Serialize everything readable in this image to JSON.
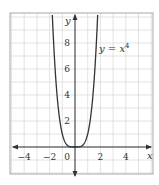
{
  "chart_data": {
    "type": "line",
    "title": "",
    "xlabel": "x",
    "ylabel": "y",
    "function": "y = x^4",
    "series": [
      {
        "name": "y = x⁴",
        "x": [
          -1.8,
          -1.6,
          -1.4,
          -1.2,
          -1.0,
          -0.8,
          -0.6,
          -0.4,
          -0.2,
          0,
          0.2,
          0.4,
          0.6,
          0.8,
          1.0,
          1.2,
          1.4,
          1.6,
          1.8
        ],
        "y": [
          10.5,
          6.55,
          3.84,
          2.07,
          1.0,
          0.41,
          0.13,
          0.026,
          0.0016,
          0,
          0.0016,
          0.026,
          0.13,
          0.41,
          1.0,
          2.07,
          3.84,
          6.55,
          10.5
        ]
      }
    ],
    "x_ticks": [
      -4,
      -2,
      0,
      2,
      4
    ],
    "x_tick_labels": [
      "−4",
      "−2",
      "0",
      "2",
      "4"
    ],
    "y_ticks": [
      2,
      4,
      6,
      8
    ],
    "y_tick_labels": [
      "2",
      "4",
      "6",
      "8"
    ],
    "xlim": [
      -5.1,
      6.1
    ],
    "ylim": [
      -2.1,
      10.3
    ],
    "grid": true,
    "grid_step": 1,
    "annotation": {
      "text_base": "y = x",
      "text_sup": "4",
      "x": 2.0,
      "y": 7.5
    }
  },
  "colors": {
    "curve": "#333333",
    "axis": "#333333",
    "grid": "#dcdcdc",
    "border": "#a8a8a8",
    "background": "#ffffff"
  },
  "labels": {
    "x_axis": "x",
    "y_axis": "y",
    "curve_base": "y = x",
    "curve_exp": "4"
  }
}
